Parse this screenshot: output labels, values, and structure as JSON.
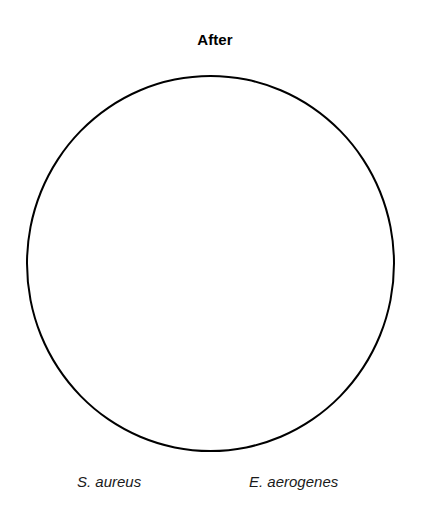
{
  "figure": {
    "title": "After",
    "background_color": "#ffffff",
    "outline_color": "#000000",
    "label_color": "#1a1a1a"
  },
  "plate": {
    "shape_name": "petri-dish-circle",
    "fill": "none",
    "stroke": "#000000",
    "stroke_width_px": 2,
    "colonies_visible": 0,
    "zones_of_inhibition_visible": 0
  },
  "organisms": [
    {
      "label": "S. aureus"
    },
    {
      "label": "E. aerogenes"
    }
  ],
  "chart_data": {
    "type": "table",
    "title": "After",
    "xlabel": "",
    "ylabel": "",
    "categories": [
      "S. aureus",
      "E. aerogenes"
    ],
    "values": [
      0,
      0
    ],
    "annotations": [],
    "legend": [],
    "grid": false
  }
}
